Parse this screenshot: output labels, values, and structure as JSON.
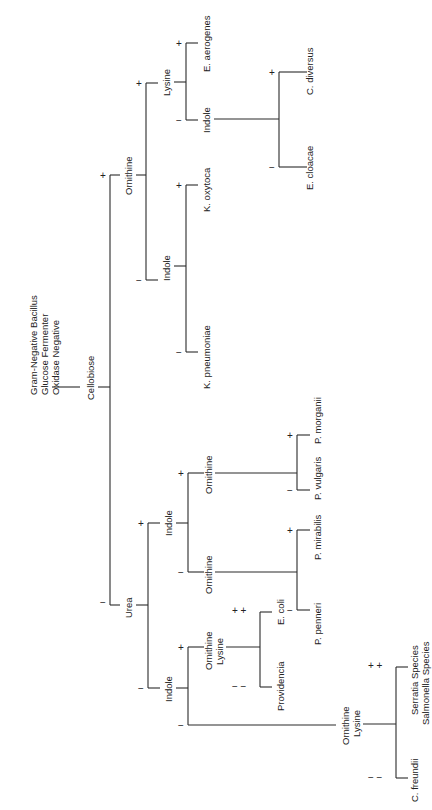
{
  "diagram": {
    "type": "dichotomous-identification-key",
    "orientation": "rotated-90-ccw",
    "root_labels": [
      "Gram-Negative Bacillus",
      "Glucose Fermenter",
      "Oxidase Negative"
    ],
    "nodes": {
      "cellobiose": "Cellobiose",
      "ornithine_top": "Ornithine",
      "lysine_top": "Lysine",
      "indole_top": "Indole",
      "indole_klebs": "Indole",
      "urea": "Urea",
      "indole_ureapos": "Indole",
      "ornithine_up_neg": "Ornithine",
      "ornithine_up_pos": "Ornithine",
      "indole_ureaneg": "Indole",
      "ornlys_mid_1": "Ornithine",
      "ornlys_mid_2": "Lysine",
      "ornlys_low_1": "Ornithine",
      "ornlys_low_2": "Lysine"
    },
    "leaves": {
      "e_aerogenes": "E. aerogenes",
      "c_diversus": "C. diversus",
      "e_cloacae": "E. cloacae",
      "k_oxytoca": "K. oxytoca",
      "k_pneumoniae": "K. pneumoniae",
      "p_morganii": "P. morganii",
      "p_vulgaris": "P. vulgaris",
      "p_mirabilis": "P. mirabilis",
      "p_penneri": "P. penneri",
      "e_coli": "E. coli",
      "providencia": "Providencia",
      "serratia": "Serratia Species",
      "salmonella": "Salmonella Species",
      "c_freundii": "C. freundii"
    },
    "signs": {
      "plus": "+",
      "minus": "−",
      "plus_plus": "+ +",
      "minus_minus": "− −"
    }
  }
}
